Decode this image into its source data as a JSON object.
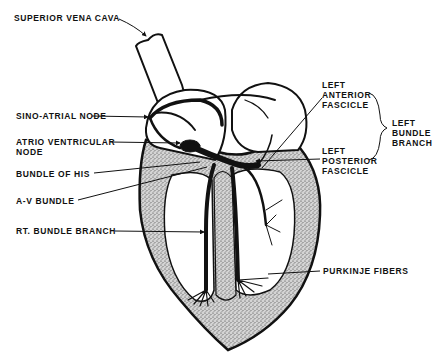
{
  "diagram": {
    "background_color": "#ffffff",
    "ink_color": "#111111",
    "myocardium_fill": "#b8b8b8"
  },
  "labels": {
    "superior_vena_cava": "SUPERIOR VENA CAVA",
    "sino_atrial_node": "SINO-ATRIAL NODE",
    "atrio_ventricular_node_line1": "ATRIO VENTRICULAR",
    "atrio_ventricular_node_line2": "NODE",
    "bundle_of_his": "BUNDLE OF HIS",
    "av_bundle": "A-V BUNDLE",
    "rt_bundle_branch": "RT. BUNDLE BRANCH",
    "left_anterior_fascicle_line1": "LEFT",
    "left_anterior_fascicle_line2": "ANTERIOR",
    "left_anterior_fascicle_line3": "FASCICLE",
    "left_posterior_fascicle_line1": "LEFT",
    "left_posterior_fascicle_line2": "POSTERIOR",
    "left_posterior_fascicle_line3": "FASCICLE",
    "left_bundle_branch_line1": "LEFT",
    "left_bundle_branch_line2": "BUNDLE",
    "left_bundle_branch_line3": "BRANCH",
    "purkinje_fibers": "PURKINJE FIBERS"
  }
}
